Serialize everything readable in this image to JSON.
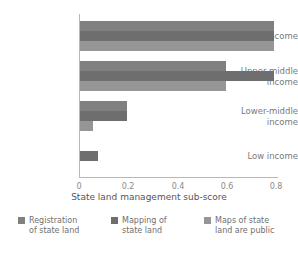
{
  "chart_data": {
    "type": "bar",
    "orientation": "horizontal",
    "title": "",
    "xlabel": "State land management sub-score",
    "ylabel": "",
    "categories": [
      "High income",
      "Upper-middle income",
      "Lower-middle income",
      "Low income"
    ],
    "series": [
      {
        "name": "Registration of state land",
        "color": "#808080",
        "values": [
          0.8,
          0.6,
          0.195,
          0
        ]
      },
      {
        "name": "Mapping of state land",
        "color": "#6e6e6e",
        "values": [
          0.8,
          0.8,
          0.195,
          0.075
        ]
      },
      {
        "name": "Maps of state land are public",
        "color": "#969696",
        "values": [
          0.8,
          0.6,
          0.055,
          0
        ]
      }
    ],
    "xticks": [
      "0",
      "0.2",
      "0.4",
      "0.6",
      "0.8"
    ],
    "xtick_values": [
      0,
      0.2,
      0.4,
      0.6,
      0.8
    ],
    "xlim": [
      0,
      0.82
    ],
    "grid": false,
    "legend_position": "bottom"
  },
  "axis": {
    "x_title": "State land management sub-score",
    "tick_0": "0",
    "tick_1": "0.2",
    "tick_2": "0.4",
    "tick_3": "0.6",
    "tick_4": "0.8"
  },
  "categories": {
    "high_income_line1": "High income",
    "upper_middle_line1": "Upper-middle",
    "upper_middle_line2": "income",
    "lower_middle_line1": "Lower-middle",
    "lower_middle_line2": "income",
    "low_income_line1": "Low income"
  },
  "legend": {
    "item0_line1": "Registration",
    "item0_line2": "of state land",
    "item1_line1": "Mapping of",
    "item1_line2": "state land",
    "item2_line1": "Maps of state",
    "item2_line2": "land are public"
  }
}
